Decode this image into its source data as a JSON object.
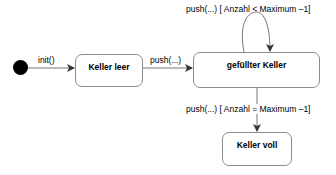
{
  "diagram": {
    "type": "UML state diagram",
    "initial_state": {
      "shape": "filled-circle"
    },
    "states": [
      {
        "id": "keller_leer",
        "label": "Keller leer"
      },
      {
        "id": "gefuellter_keller",
        "label": "gefüllter Keller"
      },
      {
        "id": "keller_voll",
        "label": "Keller voll"
      }
    ],
    "transitions": [
      {
        "from": "initial",
        "to": "keller_leer",
        "label": "init()"
      },
      {
        "from": "keller_leer",
        "to": "gefuellter_keller",
        "label": "push(...)"
      },
      {
        "from": "gefuellter_keller",
        "to": "gefuellter_keller",
        "label": "push(...) [ Anzahl < Maximum –1]"
      },
      {
        "from": "gefuellter_keller",
        "to": "keller_voll",
        "label": "push(...) [ Anzahl = Maximum –1]"
      }
    ],
    "colors": {
      "line": "#555555",
      "border": "#8c8c8c",
      "initial": "#000000"
    }
  }
}
